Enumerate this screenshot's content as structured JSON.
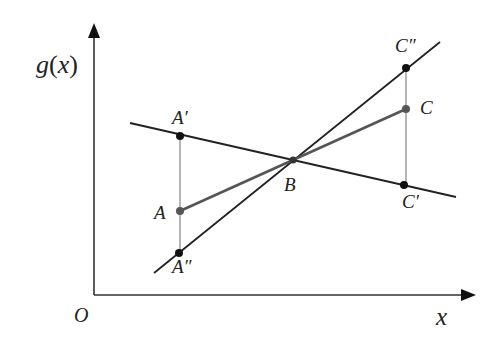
{
  "diagram": {
    "type": "geometry-construction",
    "axes": {
      "y_label_func": "g",
      "y_label_open": "(",
      "y_label_var": "x",
      "y_label_close": ")",
      "x_label": "x",
      "origin_label": "O"
    },
    "points": {
      "A_prime": {
        "label": "A′",
        "x": 180,
        "y": 136
      },
      "A": {
        "label": "A",
        "x": 180,
        "y": 211
      },
      "A_double_prime": {
        "label": "A″",
        "x": 179,
        "y": 253
      },
      "B": {
        "label": "B",
        "x": 293,
        "y": 160
      },
      "C_double_prime": {
        "label": "C″",
        "x": 406,
        "y": 68
      },
      "C": {
        "label": "C",
        "x": 406,
        "y": 109
      },
      "C_prime": {
        "label": "C′",
        "x": 404,
        "y": 185
      }
    },
    "lines": [
      {
        "name": "shallow-decreasing-line",
        "through": [
          "A′",
          "B",
          "C′"
        ]
      },
      {
        "name": "steep-increasing-line",
        "through": [
          "A″",
          "B",
          "C″"
        ]
      },
      {
        "name": "secant-segment-ABC",
        "through": [
          "A",
          "B",
          "C"
        ]
      },
      {
        "name": "vertical-left",
        "through": [
          "A′",
          "A",
          "A″"
        ]
      },
      {
        "name": "vertical-right",
        "through": [
          "C″",
          "C",
          "C′"
        ]
      }
    ],
    "colors": {
      "line": "#222222",
      "secant": "#555555",
      "vertical": "#777777",
      "point_black": "#111111",
      "point_gray": "#555555"
    }
  }
}
